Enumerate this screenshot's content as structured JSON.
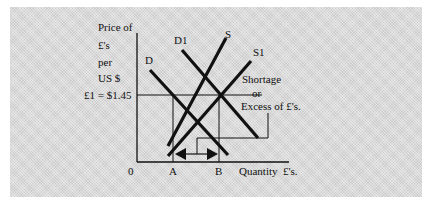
{
  "diagram": {
    "type": "supply-demand",
    "y_axis_label_lines": [
      "Price of",
      "£'s",
      "per",
      "US $"
    ],
    "price_label": "£1 = $1.45",
    "origin_label": "0",
    "x_axis_label": "Quantity  £'s.",
    "curves": {
      "d": "D",
      "d1": "D1",
      "s": "S",
      "s1": "S1"
    },
    "point_a": "A",
    "point_b": "B",
    "annotation_lines": [
      "Shortage",
      "or",
      "Excess of £'s."
    ],
    "colors": {
      "background": "#d9d9d9",
      "line": "#111111"
    }
  }
}
